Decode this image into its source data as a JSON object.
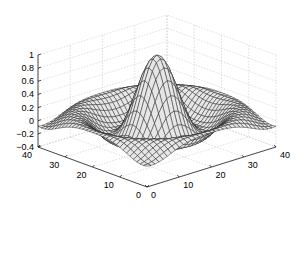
{
  "chart_data": {
    "type": "surface",
    "title": "",
    "function": "sin(r)/r, r = sqrt(x^2+y^2)",
    "xlabel": "",
    "ylabel": "",
    "zlabel": "",
    "xlim": [
      0,
      40
    ],
    "ylim": [
      0,
      40
    ],
    "zlim": [
      -0.4,
      1
    ],
    "xticks": [
      "0",
      "10",
      "20",
      "30",
      "40"
    ],
    "yticks": [
      "0",
      "10",
      "20",
      "30",
      "40"
    ],
    "zticks": [
      "-0.4",
      "-0.2",
      "0",
      "0.2",
      "0.4",
      "0.6",
      "0.8",
      "1"
    ],
    "grid": true,
    "grid_size": 33,
    "peak_value": 1,
    "min_value": -0.22,
    "colors": {
      "face": "#e6e6e6",
      "edge": "#1a1a1a",
      "grid": "#c8c8c8",
      "axis": "#000000"
    }
  },
  "axes": {
    "z_ticks": [
      {
        "label": "1",
        "y": 55
      },
      {
        "label": "0.8",
        "y": 73
      },
      {
        "label": "0.6",
        "y": 90
      },
      {
        "label": "0.4",
        "y": 108
      },
      {
        "label": "0.2",
        "y": 124
      },
      {
        "label": "0",
        "y": 141
      },
      {
        "label": "-0.2",
        "y": 158
      },
      {
        "label": "-0.4",
        "y": 175
      }
    ]
  }
}
